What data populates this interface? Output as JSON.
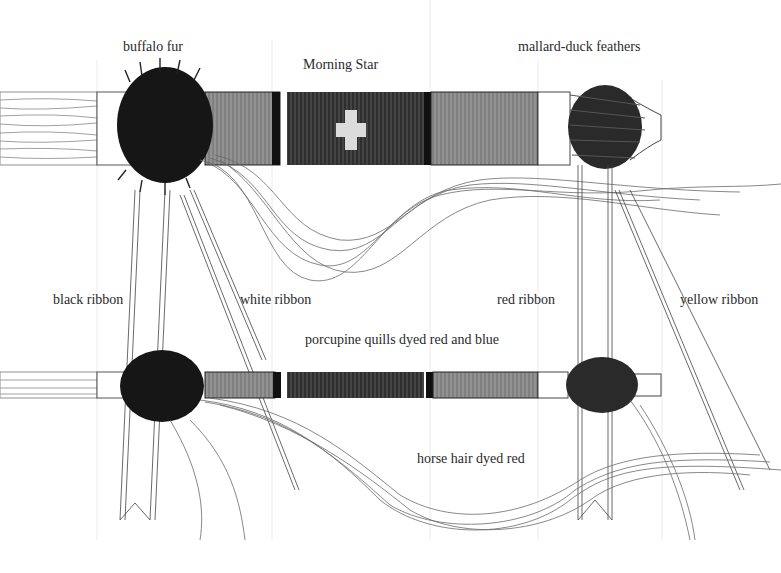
{
  "diagram": {
    "colors": {
      "background": "#ffffff",
      "ink": "#1a1a1a",
      "light_ink": "#9a9a9a",
      "band_light": "#8a8a8a",
      "band_dark": "#2e2e2e",
      "band_black": "#111111",
      "star": "#d8d8d8"
    },
    "labels": {
      "buffalo_fur": "buffalo fur",
      "morning_star": "Morning Star",
      "mallard_duck_feathers": "mallard-duck feathers",
      "black_ribbon": "black ribbon",
      "white_ribbon": "white ribbon",
      "red_ribbon": "red ribbon",
      "yellow_ribbon": "yellow ribbon",
      "porcupine_quills": "porcupine quills dyed red and blue",
      "horse_hair": "horse hair dyed red"
    },
    "stems": [
      {
        "name": "upper-stem",
        "wood_x": [
          0,
          97
        ],
        "collar_x": [
          97,
          130
        ],
        "fur_x": [
          118,
          210
        ],
        "quill_x": [
          208,
          538
        ],
        "plain_x": [
          538,
          570
        ],
        "feathers_x": [
          568,
          640
        ],
        "tip_x": [
          640,
          662
        ],
        "y": [
          92,
          165
        ]
      },
      {
        "name": "lower-stem",
        "wood_x": [
          0,
          97
        ],
        "collar_x": [
          97,
          130
        ],
        "fur_x": [
          118,
          205
        ],
        "quill_x": [
          205,
          538
        ],
        "plain_x": [
          538,
          568
        ],
        "feathers_x": [
          568,
          640
        ],
        "tip_x": [
          640,
          662
        ],
        "y": [
          372,
          398
        ]
      }
    ]
  }
}
